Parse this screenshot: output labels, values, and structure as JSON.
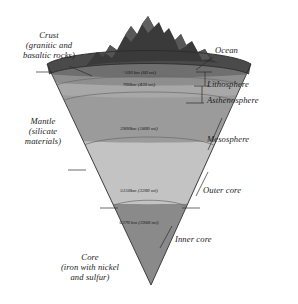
{
  "diagram": {
    "colors": {
      "crust": "#4a4a4a",
      "ocean": "#6f6f6f",
      "lithosphere": "#8e8e8e",
      "asthenosphere": "#a8a8a8",
      "mesosphere": "#9b9b9b",
      "outer_core": "#c3c3c3",
      "inner_core": "#8a8a8a",
      "mountains": "#3a3a3a",
      "line": "#2b2b2b",
      "text": "#1b1b1b"
    },
    "left_labels": [
      {
        "name": "crust",
        "text": "Crust\n(granitic and\nbasaltic rocks)"
      },
      {
        "name": "mantle",
        "text": "Mantle\n(silicate\nmaterials)"
      },
      {
        "name": "core",
        "text": "Core\n(iron with nickel\nand sulfur)"
      }
    ],
    "right_labels": [
      {
        "name": "ocean",
        "text": "Ocean"
      },
      {
        "name": "lithosphere",
        "text": "Lithosphere"
      },
      {
        "name": "asthenosphere",
        "text": "Asthenosphere"
      },
      {
        "name": "mesosphere",
        "text": "Mesosphere"
      },
      {
        "name": "outer-core",
        "text": "Outer core"
      },
      {
        "name": "inner-core",
        "text": "Inner core"
      }
    ],
    "depth_labels": [
      {
        "name": "lithosphere-base",
        "text": "~100 km (60 mi)"
      },
      {
        "name": "asthenosphere-base",
        "text": "700km (430 mi)"
      },
      {
        "name": "core-mantle-boundary",
        "text": "2900km (1800 mi)"
      },
      {
        "name": "inner-core-boundary",
        "text": "5150km (3200 mi)"
      },
      {
        "name": "earth-center",
        "text": "6370 km (3960 mi)"
      }
    ]
  }
}
